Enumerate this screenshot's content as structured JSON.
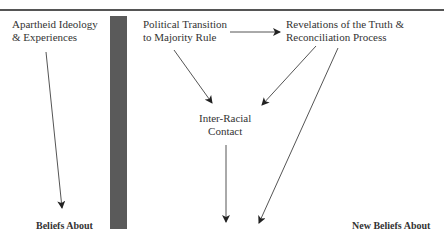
{
  "diagram": {
    "nodes": [
      {
        "id": "apartheid",
        "line1": "Apartheid Ideology",
        "line2": "& Experiences"
      },
      {
        "id": "political",
        "line1": "Political Transition",
        "line2": "to Majority Rule"
      },
      {
        "id": "revelations",
        "line1": "Revelations of the Truth &",
        "line2": "Reconciliation Process"
      },
      {
        "id": "contact",
        "line1": "Inter-Racial",
        "line2": "Contact"
      },
      {
        "id": "beliefs",
        "line1": "Beliefs About"
      },
      {
        "id": "new_beliefs",
        "line1": "New Beliefs About"
      }
    ],
    "edges": [
      {
        "from": "apartheid",
        "to": "beliefs"
      },
      {
        "from": "political",
        "to": "revelations"
      },
      {
        "from": "political",
        "to": "contact"
      },
      {
        "from": "revelations",
        "to": "contact"
      },
      {
        "from": "revelations",
        "to": "new_beliefs"
      },
      {
        "from": "contact",
        "to": "new_beliefs"
      }
    ],
    "colors": {
      "line": "#555555",
      "divider_bar": "#5a5a5a",
      "text": "#333333"
    }
  }
}
